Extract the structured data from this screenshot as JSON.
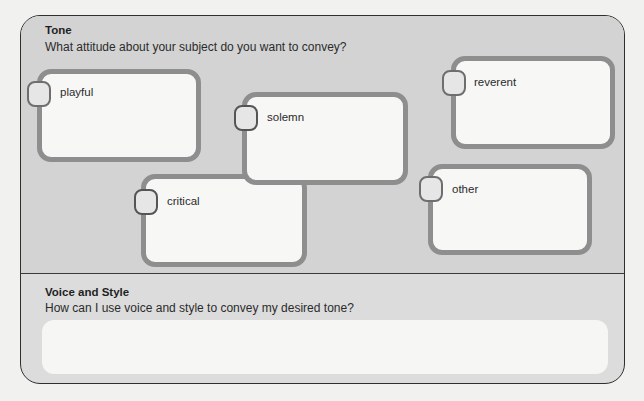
{
  "tone": {
    "title": "Tone",
    "prompt": "What attitude about your subject do you want to convey?",
    "options": [
      {
        "id": "playful",
        "label": "playful"
      },
      {
        "id": "solemn",
        "label": "solemn"
      },
      {
        "id": "critical",
        "label": "critical"
      },
      {
        "id": "reverent",
        "label": "reverent"
      },
      {
        "id": "other",
        "label": "other"
      }
    ]
  },
  "voice_and_style": {
    "title": "Voice and Style",
    "prompt": "How can I use voice and style to convey my desired tone?",
    "answer": ""
  },
  "colors": {
    "page_background": "#f1f1ef",
    "tone_section_background": "#d3d3d3",
    "voice_section_background": "#dcdcdc",
    "box_border": "#8e8e8e",
    "panel_border": "#2f2f2f"
  }
}
